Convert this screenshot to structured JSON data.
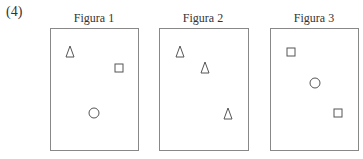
{
  "problem_label": "(4)",
  "figures": [
    {
      "title": "Figura 1",
      "box": {
        "left": 50,
        "top": 28,
        "width": 89,
        "height": 123
      },
      "shapes": [
        {
          "type": "triangle",
          "x": 70,
          "y": 52
        },
        {
          "type": "square",
          "x": 119,
          "y": 68
        },
        {
          "type": "circle",
          "x": 94,
          "y": 113
        }
      ]
    },
    {
      "title": "Figura 2",
      "box": {
        "left": 159,
        "top": 28,
        "width": 90,
        "height": 123
      },
      "shapes": [
        {
          "type": "triangle",
          "x": 180,
          "y": 52
        },
        {
          "type": "triangle",
          "x": 205,
          "y": 68
        },
        {
          "type": "triangle",
          "x": 228,
          "y": 114
        }
      ]
    },
    {
      "title": "Figura 3",
      "box": {
        "left": 270,
        "top": 28,
        "width": 89,
        "height": 123
      },
      "shapes": [
        {
          "type": "square",
          "x": 291,
          "y": 52
        },
        {
          "type": "circle",
          "x": 315,
          "y": 83
        },
        {
          "type": "square",
          "x": 338,
          "y": 113
        }
      ]
    }
  ],
  "colors": {
    "stroke": "#555555",
    "border": "#888888"
  }
}
